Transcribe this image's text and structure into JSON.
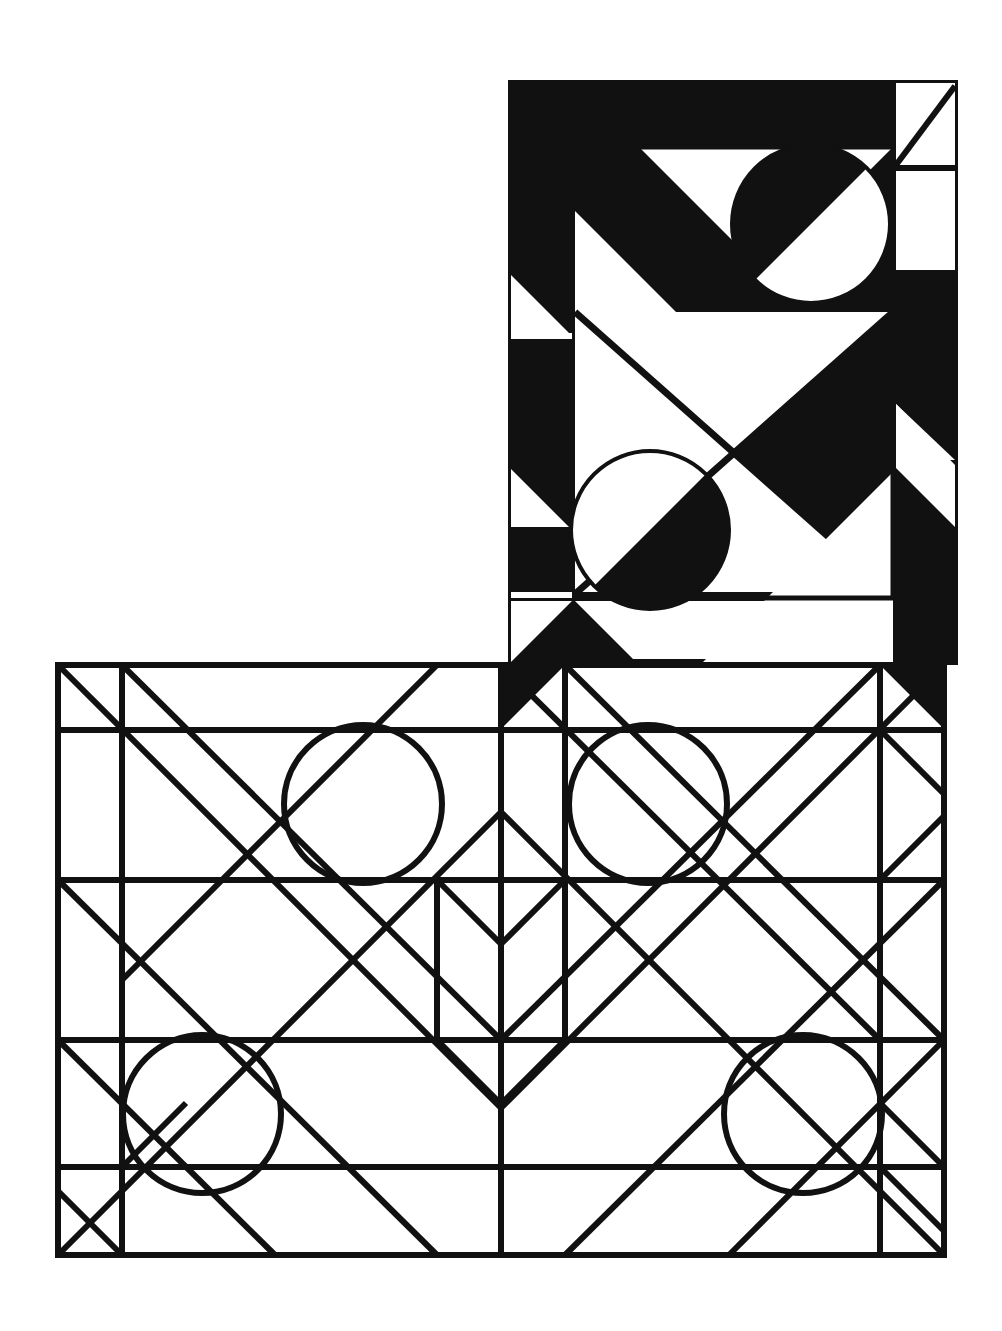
{
  "artwork": {
    "title": "",
    "caption": "",
    "background_color": "#ffffff",
    "ink_color": "#111111",
    "canvas": {
      "width": 1002,
      "height": 1331
    },
    "grid": {
      "cell": 64,
      "description": "L-shaped (inverted-L) composition on a square grid"
    },
    "blocks": [
      {
        "name": "upper-block",
        "style": "negative",
        "note": "Black-filled tower, upper right",
        "x": 508,
        "y": 80,
        "width": 450,
        "height": 585,
        "cols": 7,
        "rows": 9
      },
      {
        "name": "lower-block",
        "style": "positive",
        "note": "White with black outlines, bottom wide panel",
        "x": 58,
        "y": 665,
        "width": 886,
        "height": 590,
        "cols": 14,
        "rows": 9
      }
    ],
    "circles": [
      {
        "name": "circle-upper-right",
        "cx": 811,
        "cy": 224,
        "r": 79,
        "style": "negative"
      },
      {
        "name": "circle-upper-mid",
        "cx": 650,
        "cy": 530,
        "r": 79,
        "style": "negative"
      },
      {
        "name": "circle-lower-a",
        "cx": 363,
        "cy": 804,
        "r": 79,
        "style": "positive"
      },
      {
        "name": "circle-lower-b",
        "cx": 648,
        "cy": 804,
        "r": 79,
        "style": "positive"
      },
      {
        "name": "circle-lower-c",
        "cx": 202,
        "cy": 1114,
        "r": 79,
        "style": "positive"
      },
      {
        "name": "circle-lower-d",
        "cx": 803,
        "cy": 1114,
        "r": 79,
        "style": "positive"
      }
    ],
    "stroke_width": 6
  },
  "chart_data": {
    "type": "diagram",
    "xlabel": "",
    "ylabel": "",
    "elements": [
      "squares",
      "diagonals",
      "circles",
      "triangles"
    ]
  }
}
